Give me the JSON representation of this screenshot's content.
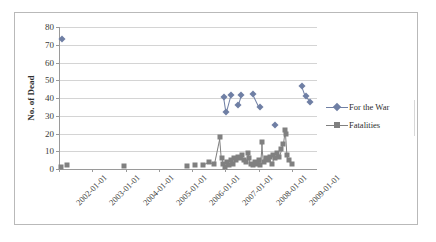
{
  "figure": {
    "background_color": "#ffffff",
    "frame_color": "#b9b9b9",
    "gridline_color": "#d4d4d4",
    "axis_color": "#9a9a9a"
  },
  "legend": {
    "position": "right",
    "entries": [
      {
        "label": "For the War",
        "marker": "diamond",
        "color": "#6f7fa4"
      },
      {
        "label": "Fatalities",
        "marker": "square",
        "color": "#808080"
      }
    ]
  },
  "chart_data": {
    "type": "scatter",
    "title": "",
    "xlabel": "",
    "ylabel": "No. of Dead",
    "ylim": [
      0,
      80
    ],
    "ytick_values": [
      0,
      10,
      20,
      30,
      40,
      50,
      60,
      70,
      80
    ],
    "ytick_labels": [
      "0",
      "10",
      "20",
      "30",
      "40",
      "50",
      "60",
      "70",
      "80"
    ],
    "xlim": [
      "2002-01-01",
      "2009-10-01"
    ],
    "xtick_labels": [
      "2002-01-01",
      "2003-01-01",
      "2004-01-01",
      "2005-01-01",
      "2006-01-01",
      "2007-01-01",
      "2008-01-01",
      "2009-01-01"
    ],
    "grid": true,
    "legend_position": "right",
    "series": [
      {
        "name": "For the War",
        "marker": "diamond",
        "color": "#6f7fa4",
        "points": [
          {
            "x": "2002-02-01",
            "y": 73
          },
          {
            "x": "2006-12-15",
            "y": 40.5
          },
          {
            "x": "2007-01-10",
            "y": 32
          },
          {
            "x": "2007-03-01",
            "y": 41.5
          },
          {
            "x": "2007-05-20",
            "y": 36
          },
          {
            "x": "2007-06-20",
            "y": 41.5
          },
          {
            "x": "2007-11-01",
            "y": 42.5
          },
          {
            "x": "2008-01-10",
            "y": 35
          },
          {
            "x": "2008-07-01",
            "y": 25
          },
          {
            "x": "2009-04-20",
            "y": 47
          },
          {
            "x": "2009-06-01",
            "y": 41
          },
          {
            "x": "2009-07-20",
            "y": 38
          }
        ]
      },
      {
        "name": "Fatalities",
        "marker": "square",
        "color": "#808080",
        "points": [
          {
            "x": "2002-01-20",
            "y": 1
          },
          {
            "x": "2002-04-01",
            "y": 2
          },
          {
            "x": "2003-12-20",
            "y": 1.5
          },
          {
            "x": "2005-11-01",
            "y": 1.5
          },
          {
            "x": "2006-02-01",
            "y": 2.5
          },
          {
            "x": "2006-05-01",
            "y": 2
          },
          {
            "x": "2006-07-01",
            "y": 4
          },
          {
            "x": "2006-09-01",
            "y": 3
          },
          {
            "x": "2006-11-01",
            "y": 18
          },
          {
            "x": "2006-11-20",
            "y": 6
          },
          {
            "x": "2006-12-10",
            "y": 3
          },
          {
            "x": "2007-01-01",
            "y": 1
          },
          {
            "x": "2007-01-20",
            "y": 4
          },
          {
            "x": "2007-02-10",
            "y": 2
          },
          {
            "x": "2007-03-01",
            "y": 5
          },
          {
            "x": "2007-03-20",
            "y": 3
          },
          {
            "x": "2007-04-10",
            "y": 6
          },
          {
            "x": "2007-05-01",
            "y": 5
          },
          {
            "x": "2007-05-20",
            "y": 7
          },
          {
            "x": "2007-06-10",
            "y": 6
          },
          {
            "x": "2007-07-01",
            "y": 8
          },
          {
            "x": "2007-07-20",
            "y": 5
          },
          {
            "x": "2007-08-10",
            "y": 4
          },
          {
            "x": "2007-09-01",
            "y": 9
          },
          {
            "x": "2007-09-20",
            "y": 6
          },
          {
            "x": "2007-10-10",
            "y": 3
          },
          {
            "x": "2007-11-01",
            "y": 2
          },
          {
            "x": "2007-11-20",
            "y": 4
          },
          {
            "x": "2007-12-10",
            "y": 3
          },
          {
            "x": "2008-01-01",
            "y": 5
          },
          {
            "x": "2008-01-20",
            "y": 2
          },
          {
            "x": "2008-02-10",
            "y": 15
          },
          {
            "x": "2008-03-01",
            "y": 4
          },
          {
            "x": "2008-03-20",
            "y": 6
          },
          {
            "x": "2008-04-10",
            "y": 5
          },
          {
            "x": "2008-05-01",
            "y": 7
          },
          {
            "x": "2008-05-20",
            "y": 3
          },
          {
            "x": "2008-06-10",
            "y": 8
          },
          {
            "x": "2008-07-01",
            "y": 6
          },
          {
            "x": "2008-07-20",
            "y": 9
          },
          {
            "x": "2008-08-10",
            "y": 7
          },
          {
            "x": "2008-09-01",
            "y": 11
          },
          {
            "x": "2008-09-20",
            "y": 14
          },
          {
            "x": "2008-10-10",
            "y": 22
          },
          {
            "x": "2008-10-25",
            "y": 20
          },
          {
            "x": "2008-11-10",
            "y": 8
          },
          {
            "x": "2008-12-01",
            "y": 5
          },
          {
            "x": "2009-01-01",
            "y": 3
          }
        ]
      }
    ]
  }
}
